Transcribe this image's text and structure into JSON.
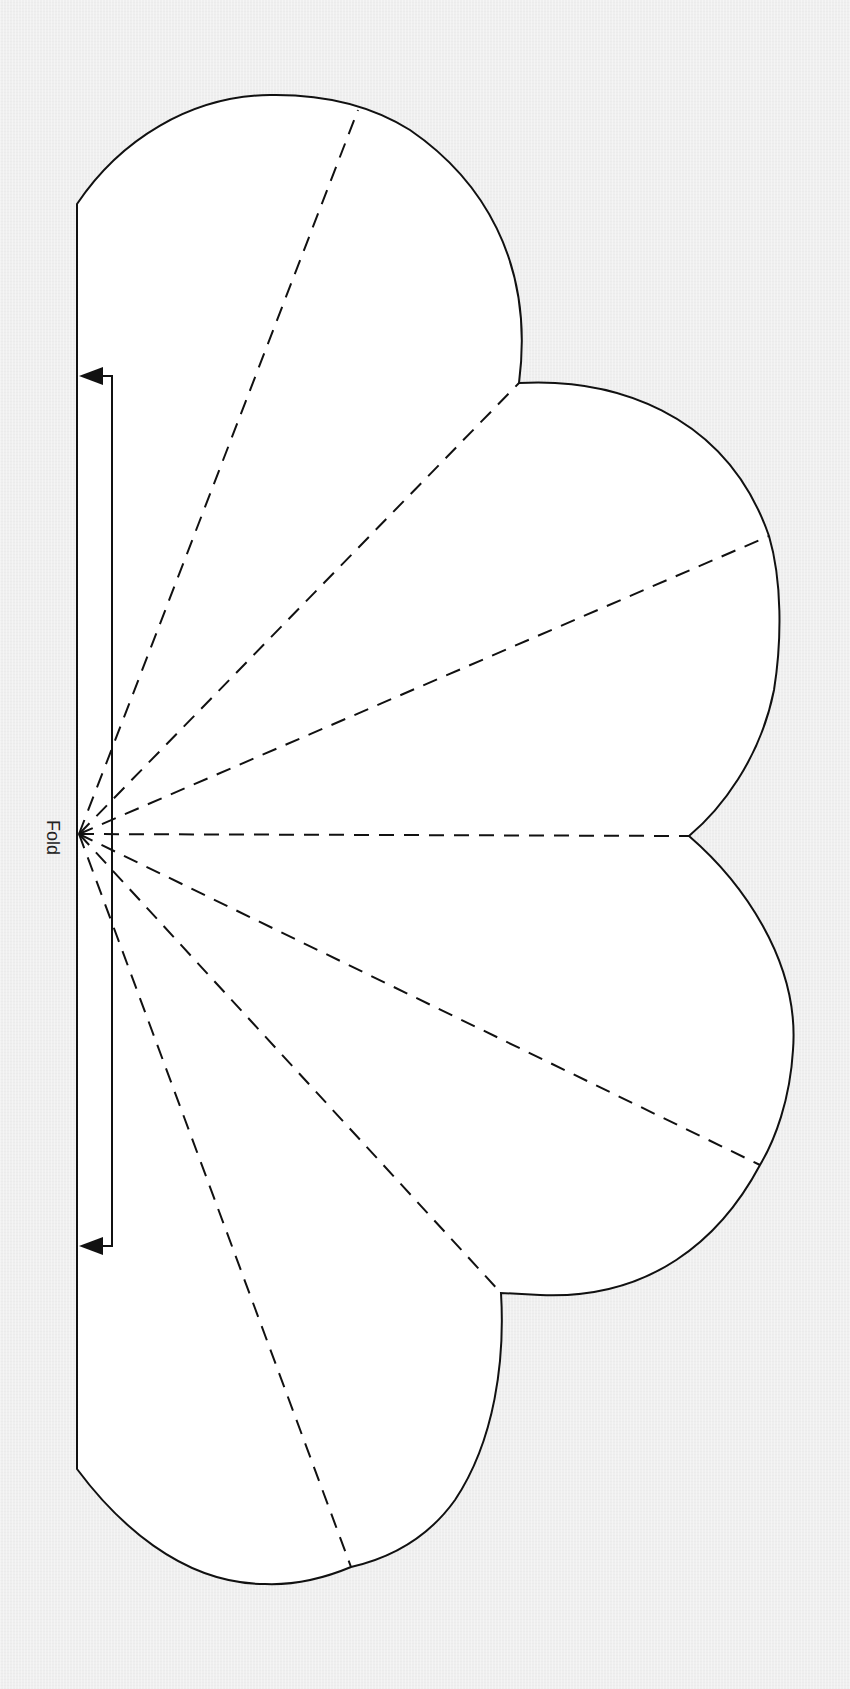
{
  "diagram": {
    "type": "sewing-pattern-template",
    "fold_label": "Fold",
    "lobe_count": 4,
    "dashed_fold_line_count": 7,
    "colors": {
      "background": "#efefef",
      "piece_fill": "#ffffff",
      "stroke": "#111111"
    },
    "annotations": [
      {
        "type": "place-on-fold-arrow",
        "direction": "left",
        "ends": [
          "top",
          "bottom"
        ]
      }
    ]
  }
}
